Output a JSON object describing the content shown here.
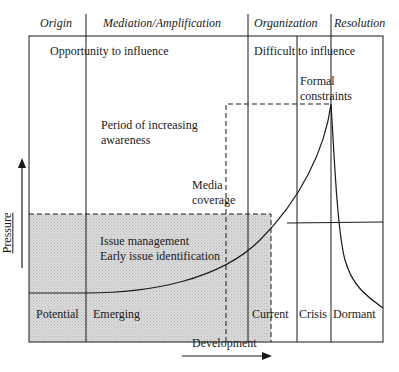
{
  "header": {
    "phases": [
      {
        "label": "Origin"
      },
      {
        "label": "Mediation/Amplification"
      },
      {
        "label": "Organization"
      },
      {
        "label": "Resolution"
      }
    ]
  },
  "regions": {
    "opportunity": "Opportunity to influence",
    "difficult": "Difficult to influence",
    "formal_constraints_line1": "Formal",
    "formal_constraints_line2": "constraints",
    "period_line1": "Period of increasing",
    "period_line2": "awareness",
    "media_line1": "Media",
    "media_line2": "coverage",
    "issue_mgmt": "Issue management",
    "early_id": "Early issue identification"
  },
  "stages": [
    {
      "label": "Potential"
    },
    {
      "label": "Emerging"
    },
    {
      "label": "Current"
    },
    {
      "label": "Crisis"
    },
    {
      "label": "Dormant"
    }
  ],
  "axes": {
    "x_label": "Development",
    "y_label": "Pressure"
  },
  "colors": {
    "line": "#1a1a1a",
    "shade": "#d4d4d4"
  }
}
